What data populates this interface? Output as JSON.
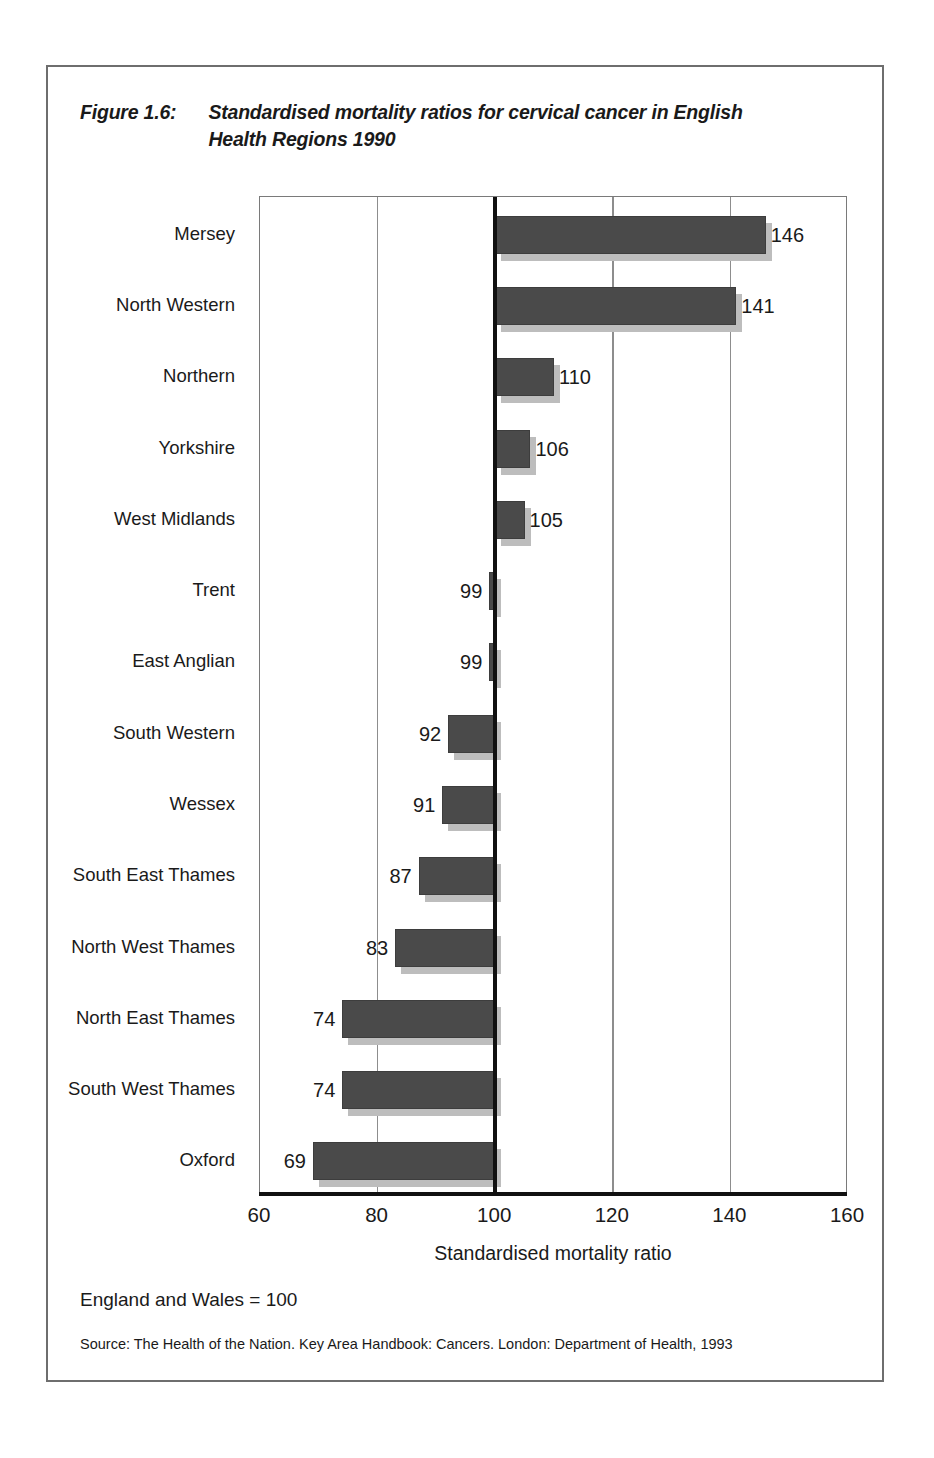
{
  "figure": {
    "number": "Figure 1.6:",
    "title": "Standardised mortality ratios for cervical cancer in English Health  Regions 1990",
    "footnote": "England and Wales = 100",
    "source": "Source: The Health of the Nation. Key Area Handbook: Cancers. London: Department of Health, 1993"
  },
  "colors": {
    "bar": "#4a4a4a",
    "bar_shadow": "#bdbdbd",
    "gridline": "#8d8d8d",
    "baseline": "#111111",
    "frame": "#6e6e6e"
  },
  "chart_data": {
    "type": "bar",
    "orientation": "horizontal",
    "title": "Standardised mortality ratios for cervical cancer in English Health  Regions 1990",
    "xlabel": "Standardised mortality ratio",
    "ylabel": "",
    "xlim": [
      60,
      160
    ],
    "xticks": [
      60,
      80,
      100,
      120,
      140,
      160
    ],
    "xtick_labels": [
      "60",
      "80",
      "100",
      "120",
      "140",
      "160"
    ],
    "reference_line": 100,
    "grid": true,
    "legend": false,
    "annotation": "England and Wales = 100",
    "categories": [
      "Mersey",
      "North Western",
      "Northern",
      "Yorkshire",
      "West Midlands",
      "Trent",
      "East Anglian",
      "South Western",
      "Wessex",
      "South East Thames",
      "North West Thames",
      "North East Thames",
      "South West Thames",
      "Oxford"
    ],
    "values": [
      146,
      141,
      110,
      106,
      105,
      99,
      99,
      92,
      91,
      87,
      83,
      74,
      74,
      69
    ],
    "value_labels": [
      "146",
      "141",
      "110",
      "106",
      "105",
      "99",
      "99",
      "92",
      "91",
      "87",
      "83",
      "74",
      "74",
      "69"
    ]
  }
}
